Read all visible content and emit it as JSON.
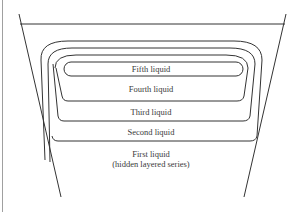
{
  "diagram": {
    "type": "nested liquid layers in a tapered vessel",
    "stroke_color": "#333333",
    "frame_color": "#9a9a9a",
    "layers": [
      {
        "index": 1,
        "label": "First liquid",
        "sublabel": "(hidden layered series)"
      },
      {
        "index": 2,
        "label": "Second liquid"
      },
      {
        "index": 3,
        "label": "Third liquid"
      },
      {
        "index": 4,
        "label": "Fourth liquid"
      },
      {
        "index": 5,
        "label": "Fifth liquid"
      }
    ]
  }
}
